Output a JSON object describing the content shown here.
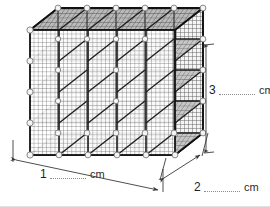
{
  "figure": {
    "projection": "oblique",
    "object": {
      "name": "wire-grid-cube-shelf",
      "cubes_wide": 5,
      "cubes_tall": 4,
      "cubes_deep": 1,
      "mesh": "wire-grid",
      "connector": "white-round-connector"
    },
    "colors": {
      "background": "#ffffff",
      "frame": "#1a1a1a",
      "mesh": "#5a5a5a",
      "mesh_light": "#9a9a9a",
      "shade_top": "#8d8d8d",
      "shade_side": "#707070",
      "connector": "#f2f2f2",
      "connector_edge": "#8a8a8a",
      "dimension_line": "#4a4a4a",
      "text": "#2b2b2b",
      "blank_rule": "#8b8b8b"
    }
  },
  "dimensions": {
    "length": {
      "number": "1",
      "unit": "cm",
      "blank": "",
      "axis": "width"
    },
    "depth": {
      "number": "2",
      "unit": "cm",
      "blank": "",
      "axis": "depth"
    },
    "height": {
      "number": "3",
      "unit": "cm",
      "blank": "",
      "axis": "height"
    }
  }
}
